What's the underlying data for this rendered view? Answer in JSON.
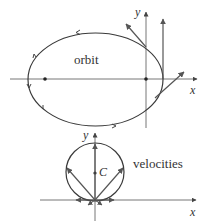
{
  "top_diagram": {
    "label": "orbit",
    "x_axis_label": "x",
    "y_axis_label": "y",
    "colors": {
      "curve": "#3a3a3a",
      "axis": "#777777",
      "arrow": "#555555"
    }
  },
  "bottom_diagram": {
    "label": "velocities",
    "center_label": "C",
    "x_axis_label": "x",
    "y_axis_label": "y",
    "colors": {
      "curve": "#3a3a3a",
      "axis": "#777777",
      "arrow": "#555555"
    }
  }
}
